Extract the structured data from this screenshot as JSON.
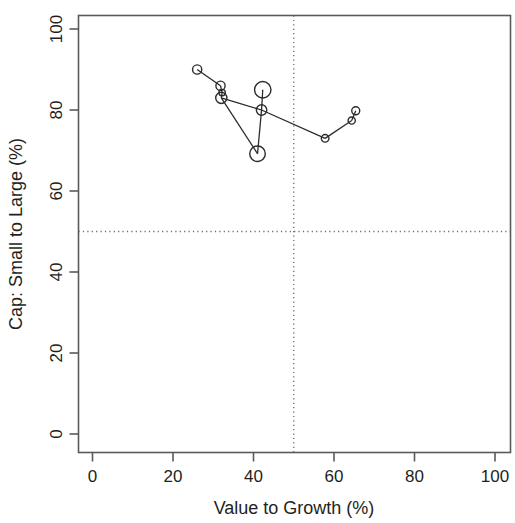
{
  "chart_data": {
    "type": "scatter",
    "title": "",
    "subtitle": "",
    "xlabel": "Value to Growth (%)",
    "ylabel": "Cap: Small to Large (%)",
    "xlim": [
      -4,
      104
    ],
    "ylim": [
      -4,
      104
    ],
    "xticks": [
      0,
      20,
      40,
      60,
      80,
      100
    ],
    "yticks": [
      0,
      20,
      40,
      60,
      80,
      100
    ],
    "xtick_labels": [
      "0",
      "20",
      "40",
      "60",
      "80",
      "100"
    ],
    "ytick_labels": [
      "0",
      "20",
      "40",
      "60",
      "80",
      "100"
    ],
    "grid": false,
    "legend": null,
    "marker": "open-circle",
    "connected": true,
    "reference_lines": [
      {
        "orientation": "vertical",
        "value": 50,
        "style": "dotted"
      },
      {
        "orientation": "horizontal",
        "value": 50,
        "style": "dotted"
      }
    ],
    "points": [
      {
        "x": 26.0,
        "y": 90.0,
        "r": 4.6
      },
      {
        "x": 31.8,
        "y": 86.0,
        "r": 4.6
      },
      {
        "x": 32.2,
        "y": 84.3,
        "r": 3.2
      },
      {
        "x": 32.0,
        "y": 83.0,
        "r": 5.6
      },
      {
        "x": 41.0,
        "y": 69.2,
        "r": 7.8
      },
      {
        "x": 42.0,
        "y": 80.0,
        "r": 5.2
      },
      {
        "x": 42.3,
        "y": 85.0,
        "r": 8.2
      },
      {
        "x": 57.8,
        "y": 73.0,
        "r": 3.8
      },
      {
        "x": 64.4,
        "y": 77.4,
        "r": 3.6
      },
      {
        "x": 65.4,
        "y": 79.8,
        "r": 4.0
      }
    ],
    "segments": [
      {
        "from": 0,
        "to": 1
      },
      {
        "from": 1,
        "to": 2
      },
      {
        "from": 2,
        "to": 3
      },
      {
        "from": 3,
        "to": 4
      },
      {
        "from": 3,
        "to": 5
      },
      {
        "from": 4,
        "to": 5
      },
      {
        "from": 5,
        "to": 6
      },
      {
        "from": 5,
        "to": 7
      },
      {
        "from": 7,
        "to": 8
      },
      {
        "from": 8,
        "to": 9
      }
    ],
    "colors": {
      "marker_stroke": "#2b2b2b",
      "line": "#2b2b2b",
      "axis": "#5a5a5a",
      "refline": "#6b6b6b",
      "text": "#231f20",
      "background": "#ffffff"
    }
  },
  "axes": {
    "x_title": "Value to Growth (%)",
    "y_title": "Cap: Small to Large (%)"
  }
}
